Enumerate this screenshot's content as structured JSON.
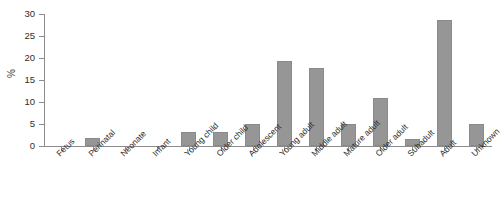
{
  "chart_data": {
    "type": "bar",
    "title": "",
    "xlabel": "",
    "ylabel": "%",
    "ylim": [
      0,
      30
    ],
    "yticks": [
      0,
      5,
      10,
      15,
      20,
      25,
      30
    ],
    "grid": false,
    "legend": null,
    "bar_color": "#969696",
    "axis_color": "#8c8c8c",
    "categories": [
      "Fetus",
      "Perinatal",
      "Neonate",
      "Infant",
      "Young child",
      "Older child",
      "Adolescent",
      "Young adult",
      "Middle adult",
      "Mature adult",
      "Older adult",
      "Subadult",
      "Adult",
      "Unknown"
    ],
    "values": [
      0,
      1.8,
      0,
      0,
      3.2,
      3.2,
      5.0,
      19.3,
      17.7,
      5.0,
      10.9,
      1.5,
      28.6,
      5.0
    ]
  }
}
